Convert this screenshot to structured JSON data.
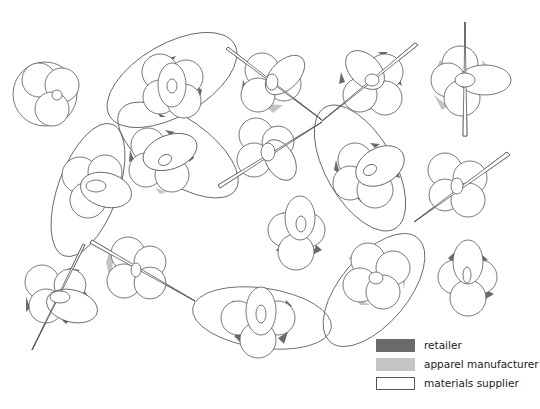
{
  "diagram": {
    "colors": {
      "retailer": "#6a6a6a",
      "apparel_manufacturer": "#c4c4c4",
      "materials_supplier": "#ffffff",
      "outline": "#555555"
    },
    "clusters": [
      {
        "id": "c1",
        "cx": 44,
        "cy": 92,
        "type": "plain-trefoil"
      },
      {
        "id": "c2",
        "cx": 170,
        "cy": 78,
        "type": "enclosed"
      },
      {
        "id": "c3",
        "cx": 273,
        "cy": 80,
        "type": "spindle"
      },
      {
        "id": "c4",
        "cx": 375,
        "cy": 78,
        "type": "spindle"
      },
      {
        "id": "c5",
        "cx": 465,
        "cy": 80,
        "type": "spindle-vertical"
      },
      {
        "id": "c6",
        "cx": 92,
        "cy": 185,
        "type": "enclosed"
      },
      {
        "id": "c7",
        "cx": 165,
        "cy": 155,
        "type": "enclosed"
      },
      {
        "id": "c8",
        "cx": 268,
        "cy": 150,
        "type": "spindle"
      },
      {
        "id": "c9",
        "cx": 367,
        "cy": 170,
        "type": "enclosed"
      },
      {
        "id": "c10",
        "cx": 458,
        "cy": 185,
        "type": "spindle"
      },
      {
        "id": "c11",
        "cx": 295,
        "cy": 230,
        "type": "plain"
      },
      {
        "id": "c12",
        "cx": 467,
        "cy": 275,
        "type": "plain"
      },
      {
        "id": "c13",
        "cx": 56,
        "cy": 296,
        "type": "spindle"
      },
      {
        "id": "c14",
        "cx": 138,
        "cy": 268,
        "type": "spindle"
      },
      {
        "id": "c15",
        "cx": 260,
        "cy": 320,
        "type": "enclosed"
      },
      {
        "id": "c16",
        "cx": 375,
        "cy": 275,
        "type": "enclosed"
      }
    ]
  },
  "legend": {
    "items": [
      {
        "label": "retailer",
        "swatch": "#6a6a6a",
        "border": "#6a6a6a"
      },
      {
        "label": "apparel manufacturer",
        "swatch": "#c4c4c4",
        "border": "#c4c4c4"
      },
      {
        "label": "materials supplier",
        "swatch": "#ffffff",
        "border": "#555555"
      }
    ]
  }
}
